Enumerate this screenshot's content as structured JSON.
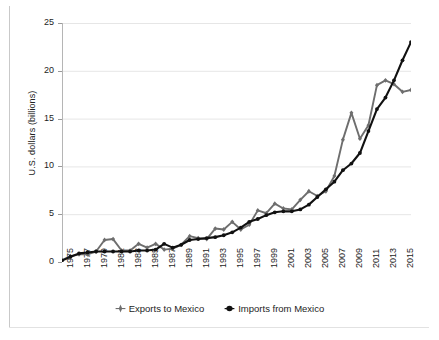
{
  "chart_data": {
    "type": "line",
    "title": "",
    "subtitle": "",
    "xlabel": "",
    "ylabel": "U.S. dollars (billions)",
    "xlim": [
      1975,
      2016
    ],
    "ylim": [
      0,
      25
    ],
    "yticks": [
      0,
      5,
      10,
      15,
      20,
      25
    ],
    "xticks": [
      1975,
      1977,
      1979,
      1981,
      1983,
      1985,
      1987,
      1989,
      1991,
      1993,
      1995,
      1997,
      1999,
      2001,
      2003,
      2005,
      2007,
      2009,
      2011,
      2013,
      2015
    ],
    "x": [
      1975,
      1976,
      1977,
      1978,
      1979,
      1980,
      1981,
      1982,
      1983,
      1984,
      1985,
      1986,
      1987,
      1988,
      1989,
      1990,
      1991,
      1992,
      1993,
      1994,
      1995,
      1996,
      1997,
      1998,
      1999,
      2000,
      2001,
      2002,
      2003,
      2004,
      2005,
      2006,
      2007,
      2008,
      2009,
      2010,
      2011,
      2012,
      2013,
      2014,
      2015,
      2016
    ],
    "grid": true,
    "legend_position": "bottom",
    "series": [
      {
        "name": "Exports to Mexico",
        "color": "#6e6e6e",
        "marker": "diamond",
        "values": [
          0.2,
          0.6,
          0.8,
          0.8,
          1.1,
          2.3,
          2.4,
          1.2,
          1.2,
          1.9,
          1.5,
          1.9,
          1.3,
          1.4,
          1.8,
          2.7,
          2.5,
          2.4,
          3.5,
          3.4,
          4.2,
          3.4,
          3.9,
          5.4,
          5.1,
          6.1,
          5.6,
          5.5,
          6.5,
          7.4,
          6.9,
          7.4,
          9.0,
          12.8,
          15.6,
          12.9,
          14.3,
          18.5,
          19.0,
          18.6,
          17.8,
          18.0
        ]
      },
      {
        "name": "Imports from Mexico",
        "color": "#111111",
        "marker": "circle",
        "values": [
          0.15,
          0.55,
          0.9,
          1.0,
          1.1,
          1.1,
          1.1,
          1.1,
          1.1,
          1.2,
          1.2,
          1.3,
          1.9,
          1.5,
          1.8,
          2.3,
          2.4,
          2.5,
          2.6,
          2.8,
          3.1,
          3.6,
          4.2,
          4.5,
          4.9,
          5.2,
          5.3,
          5.3,
          5.5,
          6.0,
          6.8,
          7.6,
          8.4,
          9.6,
          10.3,
          11.4,
          13.7,
          16.0,
          17.2,
          19.0,
          21.1,
          23.0
        ]
      }
    ]
  },
  "axis": {
    "y_tick_labels": [
      "25",
      "20",
      "15",
      "10",
      "5",
      "0"
    ],
    "x_tick_labels": [
      "1975",
      "1977",
      "1979",
      "1981",
      "1983",
      "1985",
      "1987",
      "1989",
      "1991",
      "1993",
      "1995",
      "1997",
      "1999",
      "2001",
      "2003",
      "2005",
      "2007",
      "2009",
      "2011",
      "2013",
      "2015"
    ],
    "y_title": "U.S. dollars (billions)"
  },
  "legend": {
    "items": [
      {
        "label": "Exports to Mexico",
        "color": "#6e6e6e",
        "marker": "diamond-marker"
      },
      {
        "label": "Imports from Mexico",
        "color": "#111111",
        "marker": "circle-marker"
      }
    ]
  },
  "colors": {
    "exports": "#6e6e6e",
    "imports": "#111111",
    "grid": "#e6e6e6",
    "axis": "#b5b5b5",
    "text": "#1d1d1d",
    "background": "#ffffff"
  }
}
